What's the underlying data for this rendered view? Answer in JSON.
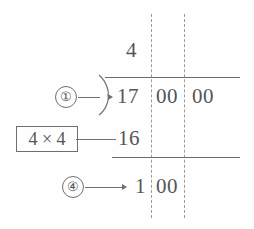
{
  "diagram": {
    "type": "long-division-square-root",
    "quotient": "4",
    "dividend_groups": [
      "17",
      "00",
      "00"
    ],
    "subtrahend": "16",
    "remainder": "1",
    "remainder_bring_down": "00",
    "markers": [
      {
        "id": "step-1",
        "label": "①",
        "points_to": "dividend-first-group"
      },
      {
        "id": "step-4",
        "label": "④",
        "points_to": "remainder-row"
      }
    ],
    "multiplication_box": "4 × 4",
    "colors": {
      "ink": "#555555",
      "rule": "#6b6b6b",
      "dashed": "#9a9a9a",
      "background": "#fefefe"
    },
    "icons": {
      "division_hook": "division-bracket-icon",
      "arrow": "arrow-right-icon"
    }
  }
}
